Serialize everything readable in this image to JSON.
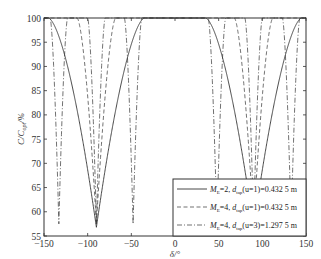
{
  "chart_data": {
    "type": "line",
    "title": "",
    "xlabel": "δ/°",
    "ylabel": "C/C_opt/%",
    "xlim": [
      -150,
      150
    ],
    "ylim": [
      55,
      100
    ],
    "xticks": [
      -150,
      -100,
      -50,
      0,
      50,
      100,
      150
    ],
    "yticks": [
      55,
      60,
      65,
      70,
      75,
      80,
      85,
      90,
      95,
      100
    ],
    "grid": false,
    "legend_position": "bottom-right",
    "series": [
      {
        "name": "M_E=2, d_tap(u=1)=0.432 5 m",
        "legend": {
          "m": "M",
          "msub": "E",
          "mval": "=2,",
          "d": "d",
          "dsub": "tap",
          "rest": "(u=1)=0.432 5 m"
        },
        "style": "solid",
        "description": "Wide dips with minima near δ=±90°",
        "dips": [
          {
            "center": -90,
            "min": 56.8,
            "halfwidth": 55
          },
          {
            "center": 90,
            "min": 56.8,
            "halfwidth": 55
          }
        ]
      },
      {
        "name": "M_E=4, d_tap(u=1)=0.432 5 m",
        "legend": {
          "m": "M",
          "msub": "E",
          "mval": "=4,",
          "d": "d",
          "dsub": "tap",
          "rest": "(u=1)=0.432 5 m"
        },
        "style": "dashed",
        "description": "Narrow dips near δ=±90°",
        "dips": [
          {
            "center": -90,
            "min": 57.5,
            "halfwidth": 22
          },
          {
            "center": 90,
            "min": 57.5,
            "halfwidth": 22
          }
        ]
      },
      {
        "name": "M_E=4, d_tap(u=3)=1.297 5 m",
        "legend": {
          "m": "M",
          "msub": "E",
          "mval": "=4,",
          "d": "d",
          "dsub": "tap",
          "rest": "(u=3)=1.297 5 m"
        },
        "style": "dashdot",
        "description": "Multiple narrow dips near δ=±48°, ±90°, ±133°",
        "dips": [
          {
            "center": -133,
            "min": 57.5,
            "halfwidth": 10
          },
          {
            "center": -90,
            "min": 57.5,
            "halfwidth": 10
          },
          {
            "center": -48,
            "min": 57.5,
            "halfwidth": 10
          },
          {
            "center": 48,
            "min": 57.5,
            "halfwidth": 10
          },
          {
            "center": 90,
            "min": 57.5,
            "halfwidth": 10
          },
          {
            "center": 133,
            "min": 57.5,
            "halfwidth": 10
          }
        ]
      }
    ]
  }
}
